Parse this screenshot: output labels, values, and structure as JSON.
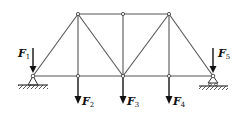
{
  "diagram": {
    "type": "truss",
    "colors": {
      "member": "#555555",
      "arrow": "#111111",
      "node_fill": "#ffffff",
      "ground": "#333333"
    },
    "nodes": [
      {
        "id": "A",
        "x": 33,
        "y": 76
      },
      {
        "id": "B",
        "x": 78,
        "y": 76
      },
      {
        "id": "C",
        "x": 123,
        "y": 76
      },
      {
        "id": "D",
        "x": 169,
        "y": 76
      },
      {
        "id": "E",
        "x": 213,
        "y": 76
      },
      {
        "id": "G",
        "x": 78,
        "y": 14
      },
      {
        "id": "H",
        "x": 123,
        "y": 14
      },
      {
        "id": "I",
        "x": 169,
        "y": 14
      }
    ],
    "members": [
      [
        "A",
        "B"
      ],
      [
        "B",
        "C"
      ],
      [
        "C",
        "D"
      ],
      [
        "D",
        "E"
      ],
      [
        "G",
        "H"
      ],
      [
        "H",
        "I"
      ],
      [
        "A",
        "G"
      ],
      [
        "G",
        "B"
      ],
      [
        "G",
        "C"
      ],
      [
        "H",
        "C"
      ],
      [
        "C",
        "I"
      ],
      [
        "I",
        "D"
      ],
      [
        "I",
        "E"
      ]
    ],
    "supports": [
      {
        "node": "A",
        "type": "pin"
      },
      {
        "node": "E",
        "type": "roller"
      }
    ],
    "loads": [
      {
        "label": "F",
        "sub": "1",
        "node": "A",
        "direction": "down"
      },
      {
        "label": "F",
        "sub": "2",
        "node": "B",
        "direction": "down"
      },
      {
        "label": "F",
        "sub": "3",
        "node": "C",
        "direction": "down"
      },
      {
        "label": "F",
        "sub": "4",
        "node": "D",
        "direction": "down"
      },
      {
        "label": "F",
        "sub": "5",
        "node": "E",
        "direction": "down"
      }
    ]
  },
  "labels": {
    "f1": {
      "main": "F",
      "sub": "1"
    },
    "f2": {
      "main": "F",
      "sub": "2"
    },
    "f3": {
      "main": "F",
      "sub": "3"
    },
    "f4": {
      "main": "F",
      "sub": "4"
    },
    "f5": {
      "main": "F",
      "sub": "5"
    }
  }
}
